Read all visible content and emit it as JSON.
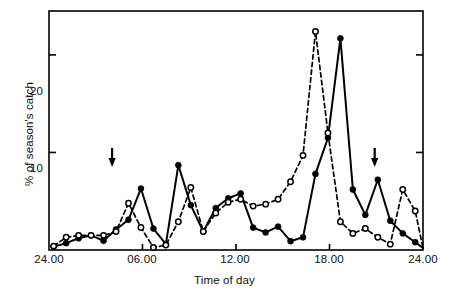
{
  "chart_data": {
    "type": "line",
    "title": "",
    "xlabel": "Time of day",
    "ylabel": "% of season's catch",
    "xlim": [
      0,
      24
    ],
    "ylim": [
      0,
      24.5
    ],
    "grid": false,
    "legend_position": "none",
    "xticks": [
      {
        "value": 0,
        "label": "24.00"
      },
      {
        "value": 6,
        "label": "06.00"
      },
      {
        "value": 12,
        "label": "12.00"
      },
      {
        "value": 18,
        "label": "18.00"
      },
      {
        "value": 24,
        "label": "24.00"
      }
    ],
    "yticks": [
      {
        "value": 10,
        "label": "10"
      },
      {
        "value": 20,
        "label": "20"
      }
    ],
    "annotations": [
      {
        "kind": "arrow-down",
        "x": 4.05,
        "label": "sunrise-arrow"
      },
      {
        "kind": "arrow-down",
        "x": 20.9,
        "label": "sunset-arrow"
      }
    ],
    "series": [
      {
        "name": "filled-circles",
        "marker": "filled-circle",
        "linestyle": "solid",
        "color": "#000000",
        "x": [
          0.3,
          1.1,
          1.9,
          2.7,
          3.5,
          4.3,
          5.1,
          5.9,
          6.7,
          7.5,
          8.3,
          9.1,
          9.9,
          10.7,
          11.5,
          12.3,
          13.1,
          13.9,
          14.7,
          15.5,
          16.3,
          17.1,
          17.9,
          18.7,
          19.5,
          20.3,
          21.1,
          21.9,
          22.7,
          23.5,
          24.0
        ],
        "y": [
          0.35,
          0.7,
          1.2,
          1.5,
          0.95,
          2.1,
          3.1,
          6.3,
          2.2,
          0.6,
          8.7,
          4.6,
          1.9,
          4.3,
          5.3,
          5.8,
          2.3,
          1.8,
          2.4,
          0.9,
          1.3,
          7.8,
          11.5,
          21.7,
          6.2,
          3.6,
          7.2,
          3.0,
          1.7,
          0.8,
          0.2
        ]
      },
      {
        "name": "open-circles",
        "marker": "open-circle",
        "linestyle": "dashed",
        "color": "#000000",
        "x": [
          0.3,
          1.1,
          1.9,
          2.7,
          3.5,
          4.3,
          5.1,
          5.9,
          6.7,
          7.5,
          8.3,
          9.1,
          9.9,
          10.7,
          11.5,
          12.3,
          13.1,
          13.9,
          14.7,
          15.5,
          16.3,
          17.1,
          17.9,
          18.7,
          19.5,
          20.3,
          21.1,
          21.9,
          22.7,
          23.5,
          24.0
        ],
        "y": [
          0.4,
          1.3,
          1.5,
          1.5,
          1.5,
          1.9,
          4.8,
          2.3,
          0.25,
          0.5,
          2.9,
          6.4,
          1.9,
          3.8,
          4.9,
          5.2,
          4.5,
          4.7,
          5.2,
          7.0,
          9.7,
          22.4,
          12.0,
          2.9,
          1.7,
          2.2,
          1.3,
          0.6,
          6.2,
          4.0,
          0.2
        ]
      }
    ]
  },
  "axis": {
    "xtick_labels": [
      "24.00",
      "06.00",
      "12.00",
      "18.00",
      "24.00"
    ],
    "ytick_labels": [
      "10",
      "20"
    ],
    "xlabel": "Time of day",
    "ylabel": "% of season's catch"
  }
}
